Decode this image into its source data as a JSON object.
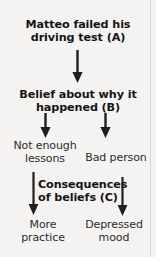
{
  "diagram": {
    "background_color": "#f4f3f1",
    "text_color": "#141414",
    "arrow_color": "#1f1f1f",
    "nodes": {
      "event": {
        "label": "Matteo failed his\ndriving test (A)",
        "stage": "A",
        "emphasis": "bold"
      },
      "belief": {
        "label": "Belief about why it\nhappened (B)",
        "stage": "B",
        "emphasis": "bold"
      },
      "belief_option_1": {
        "label": "Not enough\nlessons",
        "emphasis": "plain"
      },
      "belief_option_2": {
        "label": "Bad person",
        "emphasis": "plain"
      },
      "consequences": {
        "label": "Consequences\nof beliefs (C)",
        "stage": "C",
        "emphasis": "bold"
      },
      "outcome_1": {
        "label": "More\npractice",
        "emphasis": "plain"
      },
      "outcome_2": {
        "label": "Depressed\nmood",
        "emphasis": "plain"
      }
    },
    "connectors": [
      {
        "name": "event-to-belief",
        "from": "event",
        "to": "belief"
      },
      {
        "name": "belief-to-option-1",
        "from": "belief",
        "to": "belief_option_1"
      },
      {
        "name": "belief-to-option-2",
        "from": "belief",
        "to": "belief_option_2"
      },
      {
        "name": "option-1-to-outcome-1",
        "from": "belief_option_1",
        "to": "outcome_1"
      },
      {
        "name": "option-2-to-outcome-2",
        "from": "belief_option_2",
        "to": "outcome_2"
      }
    ]
  }
}
